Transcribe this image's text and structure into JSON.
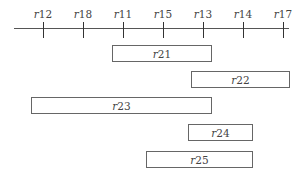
{
  "axis": {
    "ticks": [
      {
        "prefix": "r",
        "num": "12",
        "x": 43
      },
      {
        "prefix": "r",
        "num": "18",
        "x": 83
      },
      {
        "prefix": "r",
        "num": "11",
        "x": 123
      },
      {
        "prefix": "r",
        "num": "15",
        "x": 163
      },
      {
        "prefix": "r",
        "num": "13",
        "x": 203
      },
      {
        "prefix": "r",
        "num": "14",
        "x": 243
      },
      {
        "prefix": "r",
        "num": "17",
        "x": 283
      }
    ]
  },
  "intervals": [
    {
      "prefix": "r",
      "num": "21",
      "x1": 112,
      "x2": 211,
      "y": 45
    },
    {
      "prefix": "r",
      "num": "22",
      "x1": 191,
      "x2": 289,
      "y": 71
    },
    {
      "prefix": "r",
      "num": "23",
      "x1": 31,
      "x2": 211,
      "y": 97
    },
    {
      "prefix": "r",
      "num": "24",
      "x1": 188,
      "x2": 252,
      "y": 124
    },
    {
      "prefix": "r",
      "num": "25",
      "x1": 146,
      "x2": 252,
      "y": 151
    }
  ]
}
